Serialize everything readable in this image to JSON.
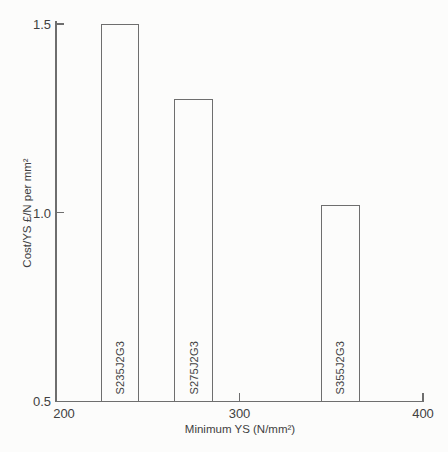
{
  "figure": {
    "bg_color": "#fcfcfb",
    "line_color": "#6e6e6e",
    "text_color": "#414141",
    "bar_fill": "#fcfcfb"
  },
  "chart_data": {
    "type": "bar",
    "title": "",
    "xlabel": "Minimum YS (N/mm²)",
    "ylabel": "Cost/YS £/N per mm²",
    "xlim": [
      200,
      400
    ],
    "ylim": [
      0.5,
      1.5
    ],
    "x_ticks": [
      {
        "value": 200,
        "label": "200"
      },
      {
        "value": 300,
        "label": "300"
      },
      {
        "value": 400,
        "label": "400"
      }
    ],
    "y_ticks": [
      {
        "value": 0.5,
        "label": "0.5"
      },
      {
        "value": 1.0,
        "label": "1.0"
      },
      {
        "value": 1.5,
        "label": "1.5"
      }
    ],
    "grid": false,
    "legend": "none",
    "bar_width_x_units": 21,
    "bars": [
      {
        "label": "S235J2G3",
        "x": 235,
        "value": 1.5
      },
      {
        "label": "S275J2G3",
        "x": 275,
        "value": 1.3
      },
      {
        "label": "S355J2G3",
        "x": 355,
        "value": 1.02
      }
    ]
  }
}
